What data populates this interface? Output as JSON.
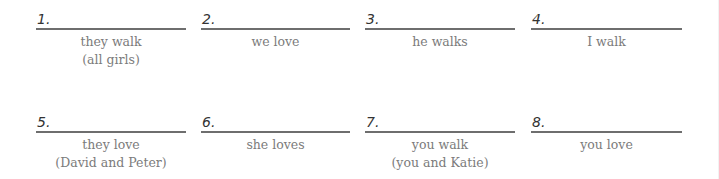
{
  "items": [
    {
      "number": "1.",
      "prompt": "they walk",
      "note": "(all girls)"
    },
    {
      "number": "2.",
      "prompt": "we love",
      "note": ""
    },
    {
      "number": "3.",
      "prompt": "he walks",
      "note": ""
    },
    {
      "number": "4.",
      "prompt": "I walk",
      "note": ""
    },
    {
      "number": "5.",
      "prompt": "they love",
      "note": "(David and Peter)"
    },
    {
      "number": "6.",
      "prompt": "she loves",
      "note": ""
    },
    {
      "number": "7.",
      "prompt": "you walk",
      "note": "(you and Katie)"
    },
    {
      "number": "8.",
      "prompt": "you love",
      "note": ""
    }
  ]
}
